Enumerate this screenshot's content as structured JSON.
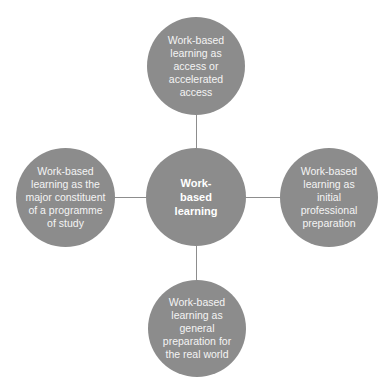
{
  "diagram": {
    "type": "hub-and-spoke",
    "colors": {
      "node_fill": "#8c8c8c",
      "node_text": "#f4f4f4",
      "connector": "#8d8d8d",
      "background": "#ffffff"
    },
    "center": {
      "label": "Work-\nbased\nlearning"
    },
    "nodes": {
      "top": {
        "label": "Work-based\nlearning as\naccess or\naccelerated\naccess"
      },
      "left": {
        "label": "Work-based\nlearning as the\nmajor constituent\nof a programme\nof study"
      },
      "right": {
        "label": "Work-based\nlearning as\ninitial\nprofessional\npreparation"
      },
      "bottom": {
        "label": "Work-based\nlearning as\ngeneral\npreparation for\nthe real world"
      }
    }
  }
}
